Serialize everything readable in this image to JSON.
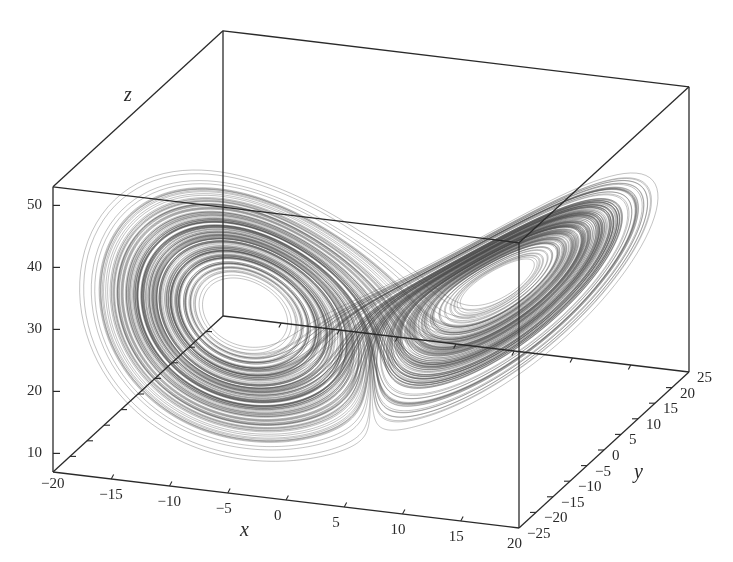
{
  "chart_data": {
    "type": "line3d",
    "title": "",
    "system": {
      "sigma": 10,
      "rho": 28,
      "beta": 2.6667
    },
    "axes": {
      "x": {
        "label": "x",
        "range": [
          -20,
          20
        ],
        "ticks": [
          -20,
          -15,
          -10,
          -5,
          0,
          5,
          10,
          15,
          20
        ],
        "tick_labels": [
          "−20",
          "−15",
          "−10",
          "−5",
          "0",
          "5",
          "10",
          "15",
          "20"
        ]
      },
      "y": {
        "label": "y",
        "range": [
          -25,
          25
        ],
        "ticks": [
          -25,
          -20,
          -15,
          -10,
          -5,
          0,
          5,
          10,
          15,
          20,
          25
        ],
        "tick_labels": [
          "−25",
          "−20",
          "−15",
          "−10",
          "−5",
          "0",
          "5",
          "10",
          "15",
          "20",
          "25"
        ]
      },
      "z": {
        "label": "z",
        "range": [
          7,
          53
        ],
        "ticks": [
          10,
          20,
          30,
          40,
          50
        ],
        "tick_labels": [
          "10",
          "20",
          "30",
          "40",
          "50"
        ]
      }
    },
    "grid": false,
    "legend": null,
    "line_color": "#555555",
    "box_color": "#2a2a2a"
  }
}
